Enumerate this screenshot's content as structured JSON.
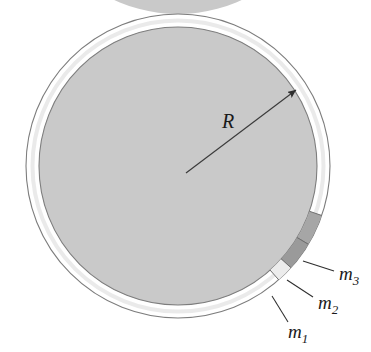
{
  "figure": {
    "background_color": "#ffffff",
    "width": 371,
    "height": 352
  },
  "ring": {
    "name": "hoop",
    "center_x": 178,
    "center_y": 166,
    "outer_radius": 152,
    "inner_radius": 139,
    "fill_color": "#c9c9c9",
    "stroke_color": "#8a8a8a",
    "highlight_color": "#dcdcdc"
  },
  "radius_arrow": {
    "label": "R",
    "label_x": 228,
    "label_y": 128,
    "from_x": 186,
    "from_y": 173,
    "to_x": 296,
    "to_y": 90,
    "color": "#3a3a3a"
  },
  "masses": [
    {
      "id": "m1",
      "label": "m",
      "subscript": "1",
      "fill_color": "#ececec",
      "stroke_color": "#6e6e6e",
      "start_angle_deg": 48.5,
      "end_angle_deg": 42.0,
      "label_x": 288,
      "label_y": 338,
      "leader_from_x": 272,
      "leader_from_y": 296,
      "leader_to_x": 288,
      "leader_to_y": 322
    },
    {
      "id": "m2",
      "label": "m",
      "subscript": "2",
      "fill_color": "#9a9a9a",
      "stroke_color": "#6e6e6e",
      "start_angle_deg": 42.0,
      "end_angle_deg": 31.0,
      "label_x": 318,
      "label_y": 309,
      "leader_from_x": 287,
      "leader_from_y": 280,
      "leader_to_x": 313,
      "leader_to_y": 297
    },
    {
      "id": "m3",
      "label": "m",
      "subscript": "3",
      "fill_color": "#a6a6a6",
      "stroke_color": "#6e6e6e",
      "start_angle_deg": 31.0,
      "end_angle_deg": 19.0,
      "label_x": 339,
      "label_y": 280,
      "leader_from_x": 303,
      "leader_from_y": 261,
      "leader_to_x": 334,
      "leader_to_y": 271
    }
  ]
}
